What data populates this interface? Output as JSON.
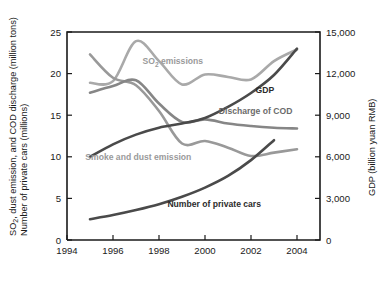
{
  "chart_data": {
    "type": "line",
    "title": "",
    "subtitle": "",
    "xlabel": "",
    "ylabel": "SO2, dust emission, and COD discharge (million tons) Number of private cars (millions)",
    "ylabel_line1": "SO",
    "ylabel_sub": "2",
    "ylabel_line1b": ", dust emission, and COD discharge (million tons)",
    "ylabel_line2": "Number of private cars (millions)",
    "y2label": "GDP (billion yuan RMB)",
    "xlim": [
      1994,
      2005
    ],
    "ylim": [
      0,
      25
    ],
    "y2lim": [
      0,
      15000
    ],
    "grid": false,
    "legend_position": "inline-annotations",
    "xticks": [
      1994,
      1996,
      1998,
      2000,
      2002,
      2004
    ],
    "xticklabels": [
      "1994",
      "1996",
      "1998",
      "2000",
      "2002",
      "2004"
    ],
    "yticks": [
      0,
      5,
      10,
      15,
      20,
      25
    ],
    "yticklabels": [
      "0",
      "5",
      "10",
      "15",
      "20",
      "25"
    ],
    "y2ticks": [
      0,
      3000,
      6000,
      9000,
      12000,
      15000
    ],
    "y2ticklabels": [
      "0",
      "3,000",
      "6,000",
      "9,000",
      "12,000",
      "15,000"
    ],
    "series": [
      {
        "name": "SO2 emissions",
        "label": "SO2 emissions",
        "label_main": "SO",
        "label_sub": "2",
        "label_rest": " emissions",
        "color": "#a9a9a9",
        "axis": "left",
        "x": [
          1995,
          1996,
          1997,
          1998,
          1999,
          2000,
          2001,
          2002,
          2003,
          2004
        ],
        "values": [
          18.9,
          19.1,
          23.9,
          21.5,
          18.7,
          19.9,
          19.6,
          19.3,
          21.5,
          22.9
        ]
      },
      {
        "name": "Smoke and dust emission",
        "label": "Smoke and dust emission",
        "color": "#999999",
        "axis": "left",
        "x": [
          1995,
          1996,
          1997,
          1998,
          1999,
          2000,
          2001,
          2002,
          2003,
          2004
        ],
        "values": [
          22.3,
          19.5,
          18.6,
          15.5,
          11.6,
          11.9,
          11.1,
          10.1,
          10.5,
          10.9
        ]
      },
      {
        "name": "Discharge of COD",
        "label": "Discharge of COD",
        "color": "#868686",
        "axis": "left",
        "x": [
          1995,
          1996,
          1997,
          1998,
          1999,
          2000,
          2001,
          2002,
          2003,
          2004
        ],
        "values": [
          17.7,
          18.5,
          19.2,
          16.4,
          14.2,
          14.5,
          14.0,
          13.7,
          13.5,
          13.4
        ]
      },
      {
        "name": "GDP",
        "label": "GDP",
        "color": "#4a4a4a",
        "axis": "right",
        "x": [
          1995,
          1996,
          1997,
          1998,
          1999,
          2000,
          2001,
          2002,
          2003,
          2004
        ],
        "values": [
          6000,
          6900,
          7600,
          8100,
          8400,
          8800,
          9600,
          10600,
          11900,
          13800
        ]
      },
      {
        "name": "Number of private cars",
        "label": "Number of private cars",
        "color": "#4a4a4a",
        "axis": "left",
        "x": [
          1995,
          1996,
          1997,
          1998,
          1999,
          2000,
          2001,
          2002,
          2003
        ],
        "values": [
          2.5,
          3.0,
          3.6,
          4.3,
          5.2,
          6.3,
          7.7,
          9.6,
          12.0
        ]
      }
    ],
    "annotations": [
      {
        "text": "SO2 emissions",
        "x": 1998.6,
        "y": 21.1
      },
      {
        "text": "GDP",
        "x": 2002.6,
        "y": 17.7
      },
      {
        "text": "Discharge of COD",
        "x": 2002.2,
        "y": 15.1
      },
      {
        "text": "Smoke and dust emission",
        "x": 1997.1,
        "y": 9.6
      },
      {
        "text": "Number of private cars",
        "x": 2000.4,
        "y": 4.0
      }
    ]
  }
}
